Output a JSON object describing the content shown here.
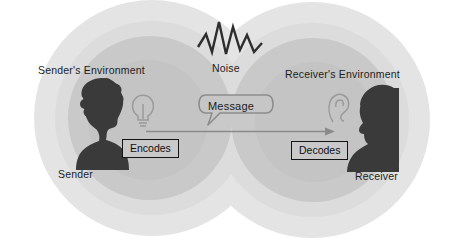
{
  "diagram": {
    "environments": [
      {
        "name": "sender-environment",
        "label": "Sender's Environment"
      },
      {
        "name": "receiver-environment",
        "label": "Receiver's Environment"
      }
    ],
    "actors": [
      {
        "name": "sender",
        "label": "Sender",
        "icon": "lightbulb-icon"
      },
      {
        "name": "receiver",
        "label": "Receiver",
        "icon": "ear-icon"
      }
    ],
    "processes": [
      {
        "name": "encodes",
        "label": "Encodes"
      },
      {
        "name": "decodes",
        "label": "Decodes"
      }
    ],
    "channel": {
      "message_label": "Message",
      "noise_label": "Noise",
      "arrow_direction": "left-to-right"
    },
    "colors": {
      "background": "#ffffff",
      "outer_ring": "#e2e2e2",
      "inner_ring": "#c8c8c8",
      "silhouette": "#3b3b3b",
      "line": "#7a7a7a",
      "text": "#1c1c1c",
      "box_fill": "#c9c9c9",
      "box_border": "#141414"
    }
  }
}
